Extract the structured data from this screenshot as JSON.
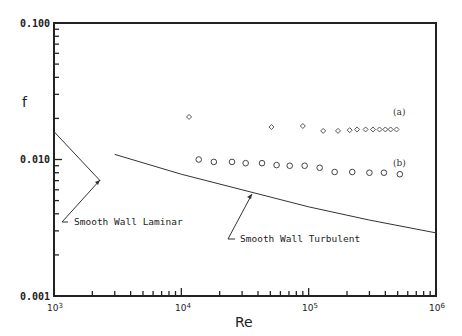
{
  "chart_data": {
    "type": "scatter",
    "title": "",
    "xlabel": "Re",
    "ylabel": "f",
    "xscale": "log",
    "yscale": "log",
    "xlim": [
      1000,
      1000000
    ],
    "ylim": [
      0.001,
      0.1
    ],
    "grid": false,
    "x_tick_labels": [
      "10^3",
      "10^4",
      "10^5",
      "10^6"
    ],
    "y_tick_labels": [
      "0.100",
      "0.010",
      "0.001"
    ],
    "series": [
      {
        "name": "(a)",
        "marker": "diamond",
        "x": [
          11500,
          51000,
          90000,
          130000,
          170000,
          210000,
          240000,
          280000,
          320000,
          360000,
          400000,
          440000,
          490000
        ],
        "y": [
          0.0205,
          0.0173,
          0.0176,
          0.0162,
          0.0162,
          0.0164,
          0.0166,
          0.0166,
          0.0166,
          0.0166,
          0.0166,
          0.0166,
          0.0166
        ]
      },
      {
        "name": "(b)",
        "marker": "circle",
        "x": [
          13700,
          18000,
          25000,
          32000,
          43000,
          56000,
          71000,
          93000,
          122000,
          160000,
          220000,
          300000,
          390000,
          520000
        ],
        "y": [
          0.01,
          0.0096,
          0.0096,
          0.0094,
          0.0094,
          0.0091,
          0.009,
          0.009,
          0.0087,
          0.0081,
          0.0081,
          0.008,
          0.008,
          0.0078
        ]
      },
      {
        "name": "Smooth Wall Laminar",
        "type": "line",
        "x": [
          1000,
          2300
        ],
        "y": [
          0.016,
          0.007
        ]
      },
      {
        "name": "Smooth Wall Turbulent",
        "type": "line",
        "x": [
          3000,
          10000,
          30000,
          100000,
          300000,
          1000000
        ],
        "y": [
          0.0109,
          0.0078,
          0.006,
          0.0045,
          0.0036,
          0.0029
        ]
      }
    ],
    "annotations": [
      "Smooth Wall Laminar",
      "Smooth Wall Turbulent",
      "(a)",
      "(b)"
    ]
  },
  "labels": {
    "y_title": "f",
    "x_title": "Re",
    "y_top": "0.100",
    "y_mid": "0.010",
    "y_bot": "0.001",
    "x_3": "10",
    "x_3_exp": "3",
    "x_4": "10",
    "x_4_exp": "4",
    "x_5": "10",
    "x_5_exp": "5",
    "x_6": "10",
    "x_6_exp": "6",
    "laminar": "Smooth Wall Laminar",
    "turbulent": "Smooth Wall Turbulent",
    "series_a": "(a)",
    "series_b": "(b)"
  }
}
